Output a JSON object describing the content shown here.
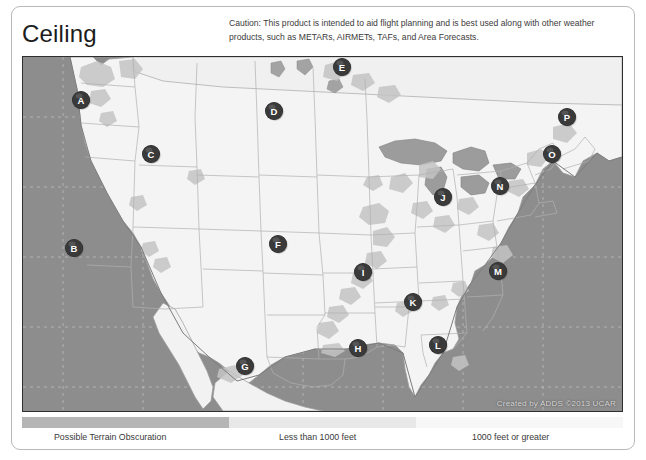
{
  "page": {
    "title": "Ceiling",
    "caution": "Caution: This product is intended to aid flight planning and is best used along with other weather products, such as METARs, AIRMETs, TAFs, and Area Forecasts."
  },
  "map": {
    "credit": "Created by ADDS ©2013 UCAR",
    "ocean_color": "#8d8d8d",
    "land_color": "#f4f4f4",
    "terrain_color": "#c9c9c9",
    "border_color": "#2e2e2e",
    "markers": [
      {
        "label": "A",
        "x": 58,
        "y": 43
      },
      {
        "label": "B",
        "x": 51,
        "y": 191
      },
      {
        "label": "C",
        "x": 128,
        "y": 97
      },
      {
        "label": "D",
        "x": 251,
        "y": 54
      },
      {
        "label": "E",
        "x": 319,
        "y": 10
      },
      {
        "label": "F",
        "x": 255,
        "y": 187
      },
      {
        "label": "G",
        "x": 222,
        "y": 309
      },
      {
        "label": "H",
        "x": 335,
        "y": 291
      },
      {
        "label": "I",
        "x": 340,
        "y": 215
      },
      {
        "label": "J",
        "x": 420,
        "y": 140
      },
      {
        "label": "K",
        "x": 390,
        "y": 245
      },
      {
        "label": "L",
        "x": 415,
        "y": 288
      },
      {
        "label": "M",
        "x": 475,
        "y": 214
      },
      {
        "label": "N",
        "x": 477,
        "y": 129
      },
      {
        "label": "O",
        "x": 529,
        "y": 97
      },
      {
        "label": "P",
        "x": 544,
        "y": 60
      }
    ]
  },
  "legend": {
    "segments": [
      {
        "name": "terrain",
        "color": "#b5b5b5"
      },
      {
        "name": "low",
        "color": "#e6e6e6"
      },
      {
        "name": "high",
        "color": "#f7f7f7"
      }
    ],
    "labels": {
      "terrain": "Possible Terrain Obscuration",
      "low": "Less than 1000 feet",
      "high": "1000 feet or greater"
    }
  }
}
